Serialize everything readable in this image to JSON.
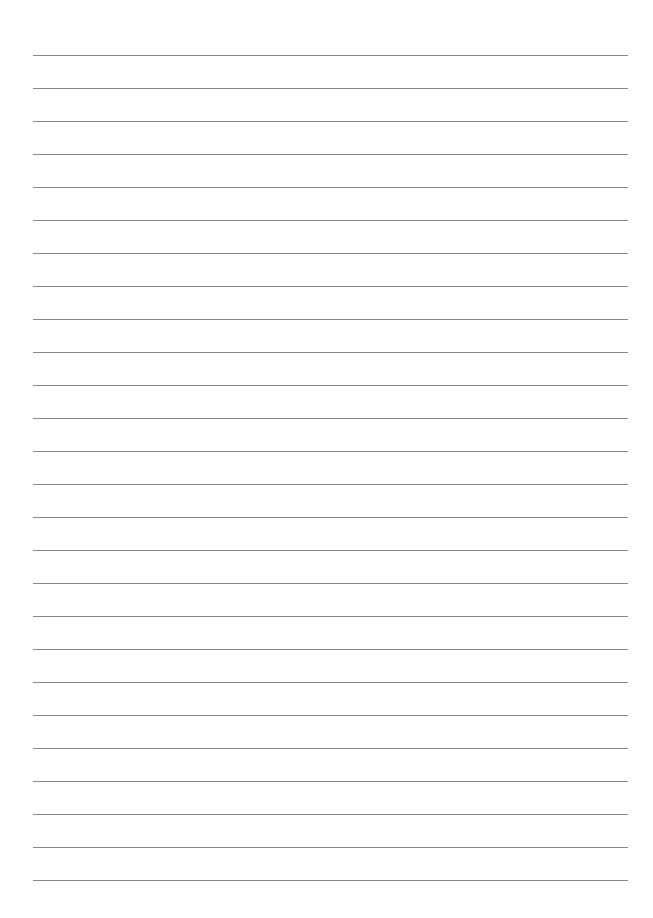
{
  "page": {
    "type": "lined-paper",
    "background": "#ffffff",
    "line_color": "#8a8a8a",
    "line_count": 26,
    "first_line_y": 55,
    "line_spacing": 33,
    "line_left": 33,
    "line_right": 628
  }
}
